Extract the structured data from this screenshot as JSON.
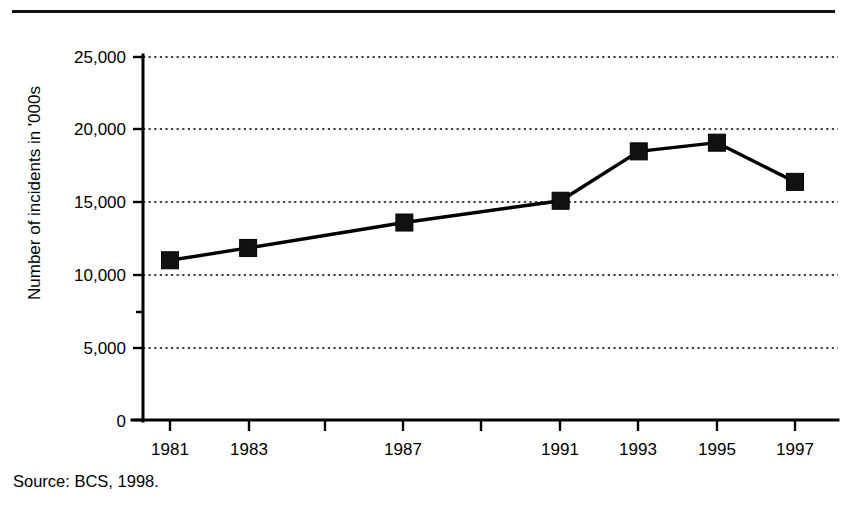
{
  "figure": {
    "source_note": "Source: BCS, 1998.",
    "has_top_rule": true,
    "background_color": "#ffffff",
    "ink_color": "#000000"
  },
  "chart_data": {
    "type": "line",
    "title": "",
    "subtitle": "",
    "xlabel": "",
    "ylabel": "Number of incidents in '000s",
    "categories": [
      "1981",
      "1983",
      "1987",
      "1991",
      "1993",
      "1995",
      "1997"
    ],
    "x": [
      1981,
      1983,
      1987,
      1991,
      1993,
      1995,
      1997
    ],
    "values": [
      11000,
      11850,
      13600,
      15100,
      18500,
      19100,
      16400
    ],
    "series": [
      {
        "name": "Number of incidents",
        "values": [
          11000,
          11850,
          13600,
          15100,
          18500,
          19100,
          16400
        ],
        "marker": "square",
        "marker_color": "#111111",
        "line_color": "#000000"
      }
    ],
    "ylim": [
      0,
      25000
    ],
    "xlim": [
      1980,
      1998
    ],
    "yticks": [
      0,
      5000,
      10000,
      15000,
      20000,
      25000
    ],
    "ytick_labels": [
      "0",
      "5,000",
      "10,000",
      "15,000",
      "20,000",
      "25,000"
    ],
    "xtick_labels": [
      "1981",
      "1983",
      "1987",
      "1991",
      "1993",
      "1995",
      "1997"
    ],
    "grid": "horizontal-dotted",
    "legend": "none",
    "annotations": []
  },
  "axes": {
    "y_axis_name": "y-axis",
    "x_axis_name": "x-axis"
  }
}
